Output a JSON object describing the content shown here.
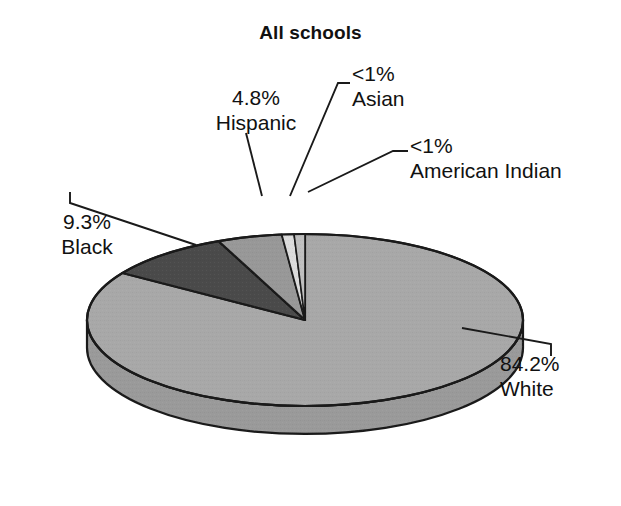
{
  "chart_data": {
    "type": "pie",
    "title": "All schools",
    "xlabel": "",
    "ylabel": "",
    "legend_position": "none",
    "grid": false,
    "three_d": true,
    "categories": [
      "White",
      "Black",
      "Hispanic",
      "Asian",
      "American Indian"
    ],
    "values": [
      84.2,
      9.3,
      4.8,
      0.9,
      0.8
    ],
    "value_labels": [
      "84.2%",
      "9.3%",
      "4.8%",
      "<1%",
      "<1%"
    ],
    "slices": [
      {
        "name": "White",
        "percent_label": "84.2%",
        "value": 84.2,
        "color": "#a8a8a8",
        "side_color": "#9a9a9a",
        "label_align": "left"
      },
      {
        "name": "Black",
        "percent_label": "9.3%",
        "value": 9.3,
        "color": "#4a4a4a",
        "side_color": "#3c3c3c",
        "label_align": "right"
      },
      {
        "name": "Hispanic",
        "percent_label": "4.8%",
        "value": 4.8,
        "color": "#989898",
        "side_color": "#8a8a8a",
        "label_align": "center"
      },
      {
        "name": "Asian",
        "percent_label": "<1%",
        "value": 0.9,
        "color": "#dcdcdc",
        "side_color": "#cbcbcb",
        "label_align": "left"
      },
      {
        "name": "American Indian",
        "percent_label": "<1%",
        "value": 0.8,
        "color": "#bfbfbf",
        "side_color": "#b0b0b0",
        "label_align": "left"
      }
    ]
  },
  "chart": {
    "title": "All schools",
    "outline_color": "#1a1a1a",
    "leader_color": "#1a1a1a",
    "background": "#ffffff"
  },
  "labels": {
    "hispanic": {
      "percent": "4.8%",
      "group": "Hispanic"
    },
    "asian": {
      "percent": "<1%",
      "group": "Asian"
    },
    "american_indian": {
      "percent": "<1%",
      "group": "American Indian"
    },
    "black": {
      "percent": "9.3%",
      "group": "Black"
    },
    "white": {
      "percent": "84.2%",
      "group": "White"
    }
  }
}
